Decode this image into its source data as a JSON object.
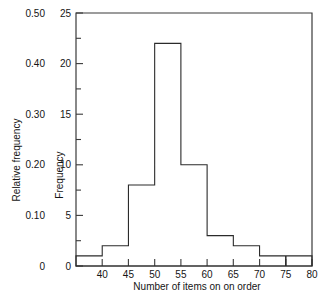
{
  "chart_data": {
    "type": "bar",
    "title": "",
    "subtitle": "",
    "xlabel": "Number of items on on order",
    "ylabel": "Frequency",
    "ylabel_secondary": "Relative frequency",
    "grid": false,
    "legend": "none",
    "xlim": [
      35,
      80
    ],
    "ylim": [
      0,
      25
    ],
    "ylim_secondary": [
      0,
      0.5
    ],
    "bin_width": 5,
    "bin_edges": [
      35,
      40,
      45,
      50,
      55,
      60,
      65,
      70,
      75,
      80
    ],
    "categories": [
      "35-40",
      "40-45",
      "45-50",
      "50-55",
      "55-60",
      "60-65",
      "65-70",
      "70-75",
      "75-80"
    ],
    "values": [
      1,
      2,
      8,
      22,
      10,
      3,
      2,
      1,
      1
    ],
    "relative_values": [
      0.02,
      0.04,
      0.16,
      0.44,
      0.2,
      0.06,
      0.04,
      0.02,
      0.02
    ],
    "total_count": 50,
    "xticks": [
      40,
      45,
      50,
      55,
      60,
      65,
      70,
      75,
      80
    ],
    "xticklabels": [
      "40",
      "45",
      "50",
      "55",
      "60",
      "65",
      "70",
      "75",
      "80"
    ],
    "yticks": [
      0,
      5,
      10,
      15,
      20,
      25
    ],
    "yticklabels": [
      "0",
      "5",
      "10",
      "15",
      "20",
      "25"
    ],
    "yticks_minor": [
      2.5,
      7.5,
      12.5,
      17.5,
      22.5
    ],
    "yticks_secondary": [
      0,
      0.1,
      0.2,
      0.3,
      0.4,
      0.5
    ],
    "yticklabels_secondary": [
      "0",
      "0.10",
      "0.20",
      "0.30",
      "0.40",
      "0.50"
    ],
    "colors": {
      "bar_stroke": "#2b2b2b",
      "bar_fill": "none",
      "axis": "#3a3a3a",
      "text": "#151515",
      "background": "#ffffff"
    }
  }
}
